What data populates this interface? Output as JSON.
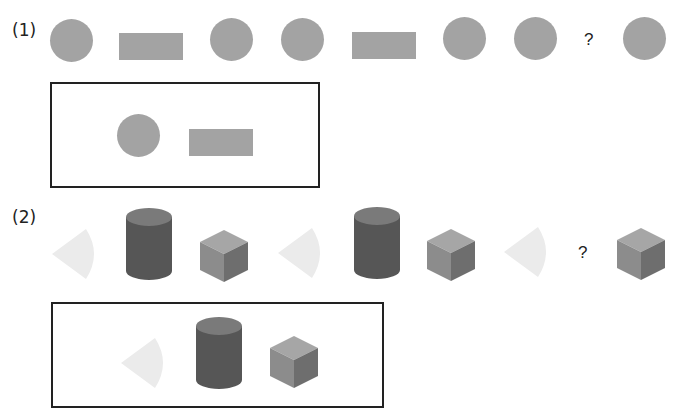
{
  "puzzle1": {
    "label": "(1)",
    "sequence": [
      "circle",
      "rectangle",
      "circle",
      "circle",
      "rectangle",
      "circle",
      "circle",
      "?",
      "circle"
    ],
    "question_mark": "?",
    "options_box": [
      "circle",
      "rectangle"
    ]
  },
  "puzzle2": {
    "label": "(2)",
    "sequence": [
      "cone",
      "cylinder",
      "cube",
      "cone",
      "cylinder",
      "cube",
      "cone",
      "?",
      "cube"
    ],
    "question_mark": "?",
    "options_box": [
      "cone",
      "cylinder",
      "cube"
    ]
  },
  "colors": {
    "flat_shape": "#a3a3a3",
    "cone": "#ebebeb",
    "cylinder_body": "#565656",
    "cylinder_top": "#7a7a7a",
    "cube_top": "#a6a6a6",
    "cube_left": "#8c8c8c",
    "cube_right": "#6e6e6e",
    "border": "#222222"
  }
}
